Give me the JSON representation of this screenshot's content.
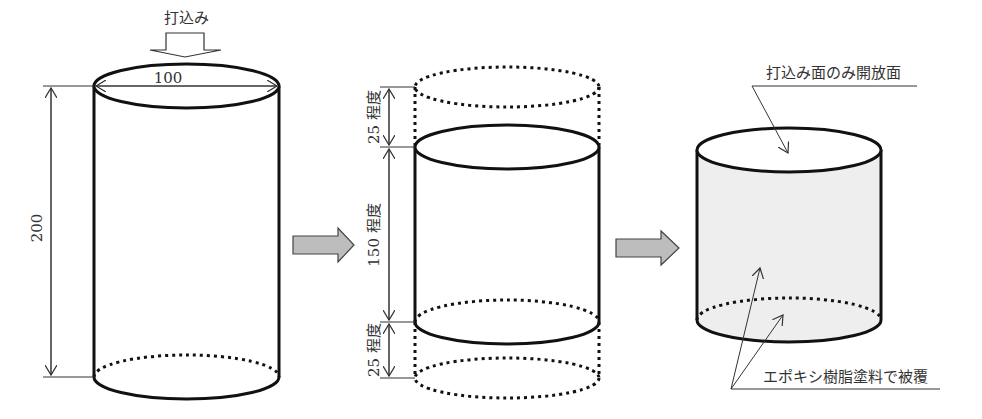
{
  "diagram": {
    "colors": {
      "line": "#111111",
      "thin_line": "#333333",
      "arrow_fill": "#bdbdbd",
      "coating_fill": "#eeeeee",
      "text": "#333333"
    },
    "stage1": {
      "pour_label": "打込み",
      "diameter_label": "100",
      "height_label": "200"
    },
    "stage2": {
      "top_trim_label": "25 程度",
      "middle_label": "150 程度",
      "bottom_trim_label": "25 程度"
    },
    "stage3": {
      "open_face_label": "打込み面のみ開放面",
      "coating_label": "エポキシ樹脂塗料で被覆"
    },
    "transition_arrows": [
      "arrow-stage1-to-stage2",
      "arrow-stage2-to-stage3"
    ]
  }
}
